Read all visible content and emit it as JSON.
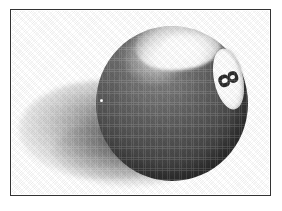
{
  "image": {
    "kind": "halftone-photograph",
    "subject": "billiard-eight-ball",
    "alt_text": "Black and white halftone illustration of a billiard eight ball inside a thin rectangular frame",
    "background_color": "#ffffff",
    "frame": {
      "name": "rectangular-border",
      "stroke_color": "#333333",
      "stroke_width_px": 1,
      "fill_color": "#ffffff",
      "left_px": 10,
      "top_px": 9,
      "width_px": 261,
      "height_px": 187
    },
    "ball": {
      "label": "8",
      "body_color": "#4a4a4a",
      "shade_dark": "#333333",
      "shade_mid": "#6b6b6b",
      "shade_light": "#7e7e7e",
      "center_x_px": 161,
      "center_y_px": 94,
      "diameter_px": 152,
      "highlight_color": "#ffffff",
      "number_disc_color": "#ffffff",
      "number_text_color": "#2b2b2b",
      "number_rotation_deg": -12
    },
    "shadow": {
      "name": "cast-shadow",
      "color": "#787878",
      "direction": "lower-left"
    }
  }
}
